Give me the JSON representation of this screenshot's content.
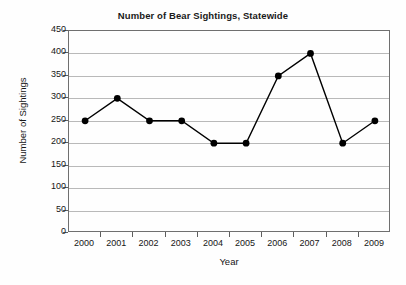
{
  "chart_data": {
    "type": "line",
    "title": "Number of Bear Sightings, Statewide",
    "xlabel": "Year",
    "ylabel": "Number of Sightings",
    "categories": [
      "2000",
      "2001",
      "2002",
      "2003",
      "2004",
      "2005",
      "2006",
      "2007",
      "2008",
      "2009"
    ],
    "values": [
      250,
      300,
      250,
      250,
      200,
      200,
      350,
      400,
      200,
      250
    ],
    "series": [
      {
        "name": "Bear Sightings",
        "values": [
          250,
          300,
          250,
          250,
          200,
          200,
          350,
          400,
          200,
          250
        ]
      }
    ],
    "ylim": [
      0,
      450
    ],
    "y_ticks": [
      0,
      50,
      100,
      150,
      200,
      250,
      300,
      350,
      400,
      450
    ],
    "y_tick_labels": [
      "0",
      "50",
      "100",
      "150",
      "200",
      "250",
      "300",
      "350",
      "400",
      "450"
    ],
    "grid": true,
    "grid_axis": "y",
    "legend": false,
    "legend_position": "none",
    "marker": "filled-circle",
    "line_color": "#000000",
    "marker_color": "#000000",
    "grid_color": "#b9b9b9",
    "axis_color": "#6f6f6f",
    "background_color": "#fefefe",
    "annotations": []
  }
}
